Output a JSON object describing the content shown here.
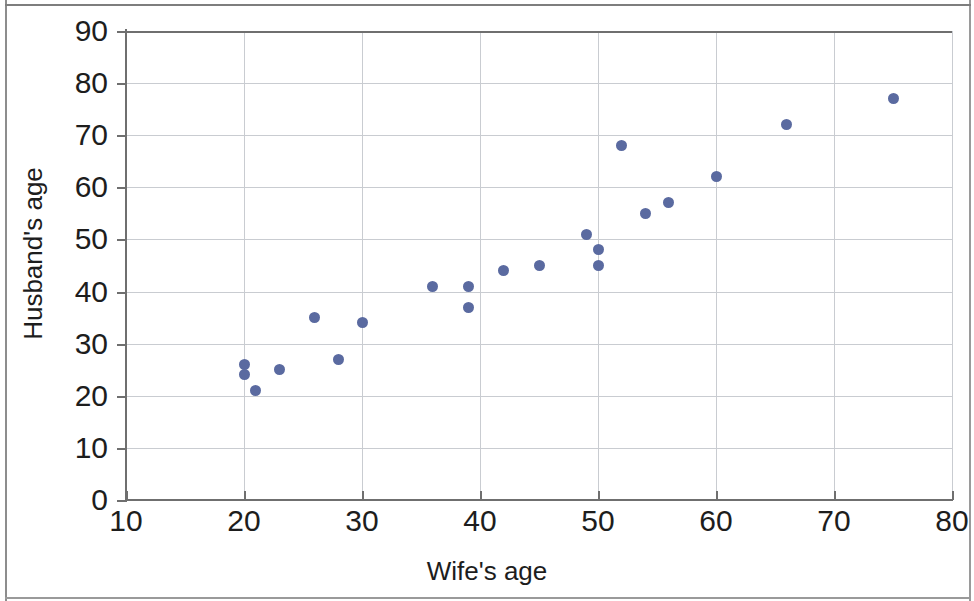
{
  "chart_data": {
    "type": "scatter",
    "title": "",
    "xlabel": "Wife's age",
    "ylabel": "Husband's age",
    "xlim": [
      10,
      80
    ],
    "ylim": [
      0,
      90
    ],
    "xticks": [
      10,
      20,
      30,
      40,
      50,
      60,
      70,
      80
    ],
    "yticks": [
      0,
      10,
      20,
      30,
      40,
      50,
      60,
      70,
      80,
      90
    ],
    "grid": true,
    "legend": null,
    "marker_color": "#5a6aa0",
    "series": [
      {
        "name": "couples",
        "points": [
          [
            20,
            26
          ],
          [
            20,
            24
          ],
          [
            21,
            21
          ],
          [
            23,
            25
          ],
          [
            26,
            35
          ],
          [
            28,
            27
          ],
          [
            30,
            34
          ],
          [
            36,
            41
          ],
          [
            39,
            41
          ],
          [
            39,
            37
          ],
          [
            42,
            44
          ],
          [
            45,
            45
          ],
          [
            49,
            51
          ],
          [
            50,
            48
          ],
          [
            50,
            45
          ],
          [
            52,
            68
          ],
          [
            54,
            55
          ],
          [
            56,
            57
          ],
          [
            60,
            62
          ],
          [
            66,
            72
          ],
          [
            75,
            77
          ]
        ]
      }
    ]
  }
}
